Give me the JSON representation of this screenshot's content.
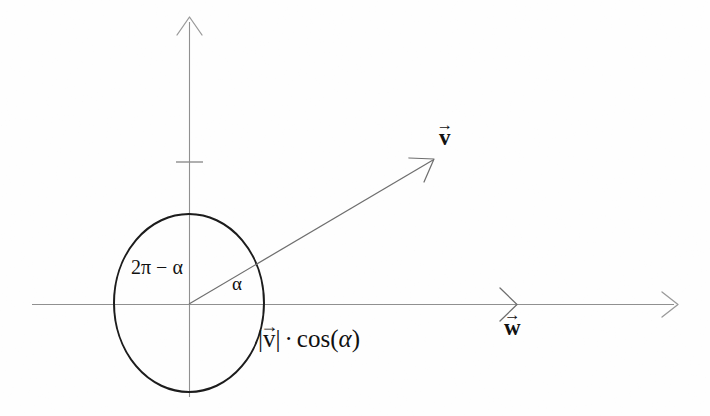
{
  "figure": {
    "type": "vector-projection-diagram",
    "background_color": "#fefefe",
    "ink_color": "#111111",
    "axis_color": "#8a8a8a",
    "labels": {
      "vector_v": "v",
      "vector_w": "w",
      "angle_alpha": "α",
      "reflex_angle": "2π − α",
      "projection_magnitude": "v",
      "projection_separator": "·",
      "projection_function": "cos(",
      "projection_arg": "α",
      "projection_close": ")",
      "arrow_accent": "→",
      "abs_bar": "|"
    },
    "geometry": {
      "origin": [
        189,
        304
      ],
      "x_axis": {
        "start": [
          32,
          304
        ],
        "end": [
          678,
          304
        ],
        "arrowhead": "right"
      },
      "y_axis": {
        "start": [
          189,
          397
        ],
        "end": [
          189,
          17
        ],
        "arrowhead": "up"
      },
      "y_axis_tick_y": 162,
      "unit_circle": {
        "cx": 189,
        "cy": 303,
        "rx": 75,
        "ry": 89
      },
      "vector_v": {
        "from": [
          189,
          304
        ],
        "to": [
          434,
          160
        ]
      },
      "vector_w_marker_x": 513,
      "drop_line": {
        "x": 434,
        "from_y": 160,
        "to_y": 381
      },
      "projection_segment": {
        "y": 343,
        "from_x": 190,
        "to_x": 253
      },
      "projection_tail_segment": {
        "y": 343,
        "from_x": 408,
        "to_x": 434
      }
    },
    "label_positions": {
      "vector_v": [
        441,
        128
      ],
      "vector_w": [
        503,
        318
      ],
      "angle_alpha": [
        232,
        273
      ],
      "reflex_angle": [
        131,
        256
      ],
      "projection_label": [
        258,
        325
      ]
    }
  }
}
